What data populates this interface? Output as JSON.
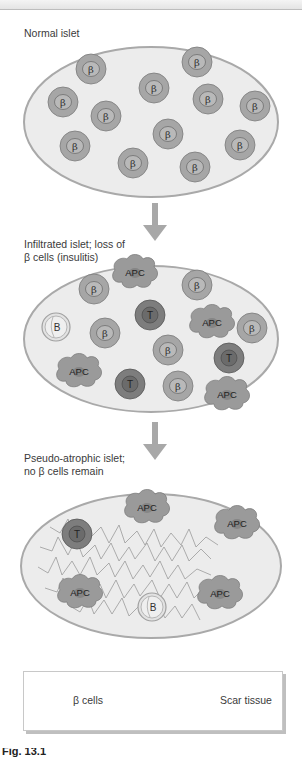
{
  "stages": [
    {
      "label": "Normal islet"
    },
    {
      "label_line1": "Infiltrated islet; loss of",
      "label_line2": "β cells (insulitis)"
    },
    {
      "label_line1": "Pseudo-atrophic islet;",
      "label_line2": "no β cells remain"
    }
  ],
  "cells": {
    "beta": "β",
    "t_cell": "T",
    "apc": "APC",
    "damaged_beta": "B"
  },
  "legend": {
    "beta_label": "β cells",
    "scar_label": "Scar tissue",
    "beta_symbol": "β"
  },
  "caption": {
    "text": "Fig. 13.1"
  },
  "colors": {
    "islet_fill": "#ececec",
    "islet_stroke": "#a9a9a9",
    "beta_fill": "#a6a6a6",
    "beta_nucleus": "#b9b9b9",
    "t_cell_fill": "#7d7d7d",
    "apc_fill": "#9a9a9a",
    "arrow": "#a8a8a8"
  }
}
